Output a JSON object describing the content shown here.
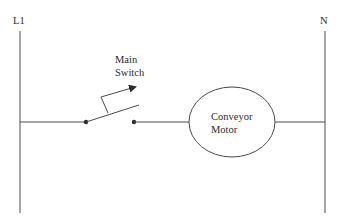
{
  "diagram": {
    "type": "ladder-logic",
    "rails": {
      "left_label": "L1",
      "right_label": "N"
    },
    "rung": {
      "switch": {
        "label_line1": "Main",
        "label_line2": "Switch",
        "state": "open"
      },
      "load": {
        "label_line1": "Conveyor",
        "label_line2": "Motor"
      }
    },
    "colors": {
      "line": "#4a4a4a",
      "text": "#2a2a2a",
      "background": "#ffffff"
    }
  }
}
